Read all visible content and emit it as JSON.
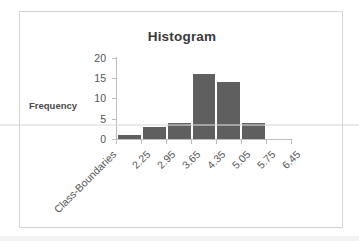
{
  "chart_data": {
    "type": "bar",
    "title": "Histogram",
    "xlabel": "Class-Boundaries",
    "ylabel": "Frequency",
    "categories": [
      "2.25",
      "2.95",
      "3.65",
      "4.35",
      "5.05",
      "5.75",
      "6.45"
    ],
    "values": [
      1,
      3,
      4,
      16,
      14,
      4,
      0
    ],
    "ylim": [
      0,
      20
    ],
    "yticks": [
      0,
      5,
      10,
      15,
      20
    ],
    "ytick_labels": [
      "0",
      "5",
      "10",
      "15",
      "20"
    ],
    "xtick_labels": [
      "2.25",
      "2.95",
      "3.65",
      "4.35",
      "5.05",
      "5.75",
      "6.45"
    ],
    "grid": false,
    "legend": false,
    "bar_color": "#5f5f5f",
    "axis_color": "#bdbdbd",
    "text_color": "#555555",
    "title_color": "#3a3a3a",
    "frame_border_color": "#d4d4d4",
    "background": "#ffffff"
  }
}
